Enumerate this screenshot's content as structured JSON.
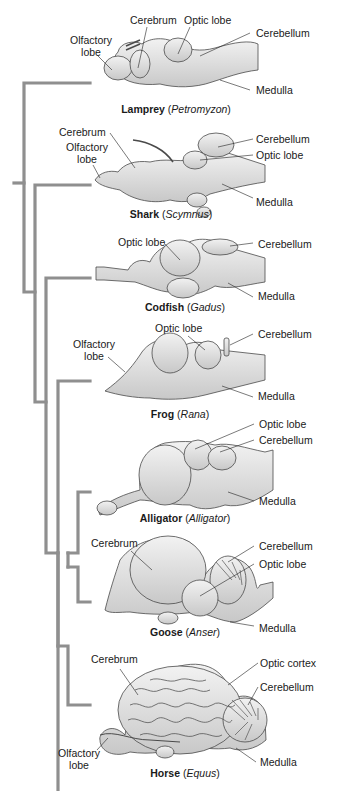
{
  "colors": {
    "tree_line": "#8f8f8f",
    "brain_fill": "#e4e4e4",
    "brain_shade": "#c9c9c9",
    "brain_stroke": "#4a4a4a",
    "leader_line": "#222222",
    "text": "#1a1a1a"
  },
  "figure": {
    "type": "cladogram"
  },
  "animals": [
    {
      "common": "Lamprey",
      "genus": "Petromyzon",
      "labels": [
        "Cerebrum",
        "Optic lobe",
        "Olfactory lobe",
        "Cerebellum",
        "Medulla"
      ]
    },
    {
      "common": "Shark",
      "genus": "Scymnus",
      "labels": [
        "Cerebrum",
        "Olfactory lobe",
        "Cerebellum",
        "Optic lobe",
        "Medulla"
      ]
    },
    {
      "common": "Codfish",
      "genus": "Gadus",
      "labels": [
        "Optic lobe",
        "Cerebellum",
        "Medulla"
      ]
    },
    {
      "common": "Frog",
      "genus": "Rana",
      "labels": [
        "Optic lobe",
        "Olfactory lobe",
        "Cerebellum",
        "Medulla"
      ]
    },
    {
      "common": "Alligator",
      "genus": "Alligator",
      "labels": [
        "Optic lobe",
        "Cerebellum",
        "Medulla"
      ]
    },
    {
      "common": "Goose",
      "genus": "Anser",
      "labels": [
        "Cerebrum",
        "Cerebellum",
        "Optic lobe",
        "Medulla"
      ]
    },
    {
      "common": "Horse",
      "genus": "Equus",
      "labels": [
        "Cerebrum",
        "Optic cortex",
        "Cerebellum",
        "Olfactory lobe",
        "Medulla"
      ]
    }
  ],
  "text": {
    "cerebrum": "Cerebrum",
    "optic_lobe": "Optic lobe",
    "olfactory_1": "Olfactory",
    "olfactory_2": "lobe",
    "cerebellum": "Cerebellum",
    "medulla": "Medulla",
    "optic_cortex": "Optic cortex"
  }
}
